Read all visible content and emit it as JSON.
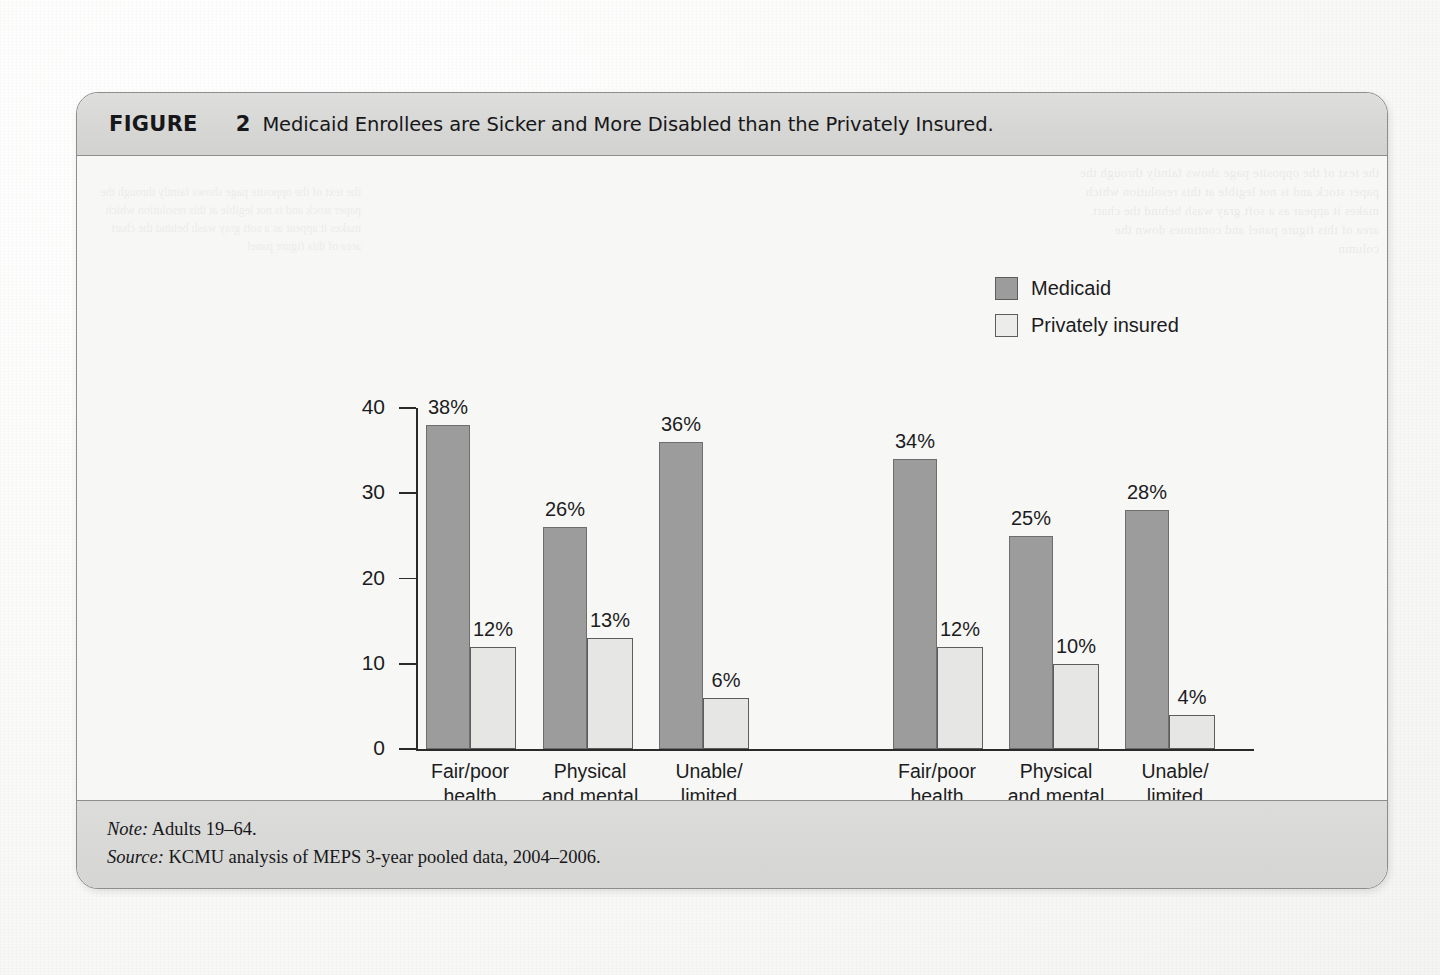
{
  "figure": {
    "label": "FIGURE",
    "number": "2",
    "title": "Medicaid Enrollees are Sicker and More Disabled than the Privately Insured."
  },
  "footer": {
    "note_key": "Note:",
    "note_text": " Adults 19–64.",
    "source_key": "Source:",
    "source_text": " KCMU analysis of MEPS 3-year pooled data, 2004–2006."
  },
  "colors": {
    "medicaid_fill": "#9c9c9c",
    "private_fill": "#e6e6e4",
    "axis": "#2a2a2a",
    "card_bg": "#f7f7f5",
    "band_bg": "#d6d6d4"
  },
  "chart_data": {
    "type": "bar",
    "title": "Medicaid Enrollees are Sicker and More Disabled than the Privately Insured.",
    "xlabel": "",
    "ylabel": "",
    "ylim": [
      0,
      40
    ],
    "yticks": [
      0,
      10,
      20,
      30,
      40
    ],
    "ytick_labels": [
      "0",
      "10",
      "20",
      "30",
      "40"
    ],
    "grid": false,
    "legend_position": "top-right",
    "legend": [
      "Medicaid",
      "Privately insured"
    ],
    "categories": [
      "Fair/poor\nhealth",
      "Physical\nand mental\nchronic\ncondition",
      "Unable/\nlimited\nwork due\nto health",
      "Fair/poor\nhealth",
      "Physical\nand mental\nchronic\ncondition",
      "Unable/\nlimited\nwork due\nto health"
    ],
    "groups": [
      {
        "name": "Poor",
        "sublabel": "(<100% FPL)",
        "categories": [
          "Fair/poor\nhealth",
          "Physical\nand mental\nchronic\ncondition",
          "Unable/\nlimited\nwork due\nto health"
        ]
      },
      {
        "name": "Near poor",
        "sublabel": "(100–199% FPL)",
        "categories": [
          "Fair/poor\nhealth",
          "Physical\nand mental\nchronic\ncondition",
          "Unable/\nlimited\nwork due\nto health"
        ]
      }
    ],
    "series": [
      {
        "name": "Medicaid",
        "values": [
          38,
          26,
          36,
          34,
          25,
          28
        ],
        "labels": [
          "38%",
          "26%",
          "36%",
          "34%",
          "25%",
          "28%"
        ]
      },
      {
        "name": "Privately insured",
        "values": [
          12,
          13,
          6,
          12,
          10,
          4
        ],
        "labels": [
          "12%",
          "13%",
          "6%",
          "12%",
          "10%",
          "4%"
        ]
      }
    ]
  },
  "bar_layout": [
    {
      "group": 0,
      "cat": 0,
      "series": "Medicaid",
      "x": 349,
      "w": 44,
      "value": 38,
      "label": "38%"
    },
    {
      "group": 0,
      "cat": 0,
      "series": "Privately insured",
      "x": 393,
      "w": 46,
      "value": 12,
      "label": "12%"
    },
    {
      "group": 0,
      "cat": 1,
      "series": "Medicaid",
      "x": 466,
      "w": 44,
      "value": 26,
      "label": "26%"
    },
    {
      "group": 0,
      "cat": 1,
      "series": "Privately insured",
      "x": 510,
      "w": 46,
      "value": 13,
      "label": "13%"
    },
    {
      "group": 0,
      "cat": 2,
      "series": "Medicaid",
      "x": 582,
      "w": 44,
      "value": 36,
      "label": "36%"
    },
    {
      "group": 0,
      "cat": 2,
      "series": "Privately insured",
      "x": 626,
      "w": 46,
      "value": 6,
      "label": "6%"
    },
    {
      "group": 1,
      "cat": 0,
      "series": "Medicaid",
      "x": 816,
      "w": 44,
      "value": 34,
      "label": "34%"
    },
    {
      "group": 1,
      "cat": 0,
      "series": "Privately insured",
      "x": 860,
      "w": 46,
      "value": 12,
      "label": "12%"
    },
    {
      "group": 1,
      "cat": 1,
      "series": "Medicaid",
      "x": 932,
      "w": 44,
      "value": 25,
      "label": "25%"
    },
    {
      "group": 1,
      "cat": 1,
      "series": "Privately insured",
      "x": 976,
      "w": 46,
      "value": 10,
      "label": "10%"
    },
    {
      "group": 1,
      "cat": 2,
      "series": "Medicaid",
      "x": 1048,
      "w": 44,
      "value": 28,
      "label": "28%"
    },
    {
      "group": 1,
      "cat": 2,
      "series": "Privately insured",
      "x": 1092,
      "w": 46,
      "value": 4,
      "label": "4%"
    }
  ],
  "cat_label_layout": [
    {
      "x": 341,
      "w": 104,
      "text": "Fair/poor\nhealth"
    },
    {
      "x": 452,
      "w": 122,
      "text": "Physical\nand mental\nchronic\ncondition"
    },
    {
      "x": 578,
      "w": 108,
      "text": "Unable/\nlimited\nwork due\nto health"
    },
    {
      "x": 808,
      "w": 104,
      "text": "Fair/poor\nhealth"
    },
    {
      "x": 918,
      "w": 122,
      "text": "Physical\nand mental\nchronic\ncondition"
    },
    {
      "x": 1044,
      "w": 108,
      "text": "Unable/\nlimited\nwork due\nto health"
    }
  ],
  "group_layout": [
    {
      "rule_x": 340,
      "rule_w": 350,
      "name": "Poor",
      "sub": "(<100% FPL)"
    },
    {
      "rule_x": 840,
      "rule_w": 325,
      "name": "Near poor",
      "sub": "(100–199% FPL)"
    }
  ]
}
